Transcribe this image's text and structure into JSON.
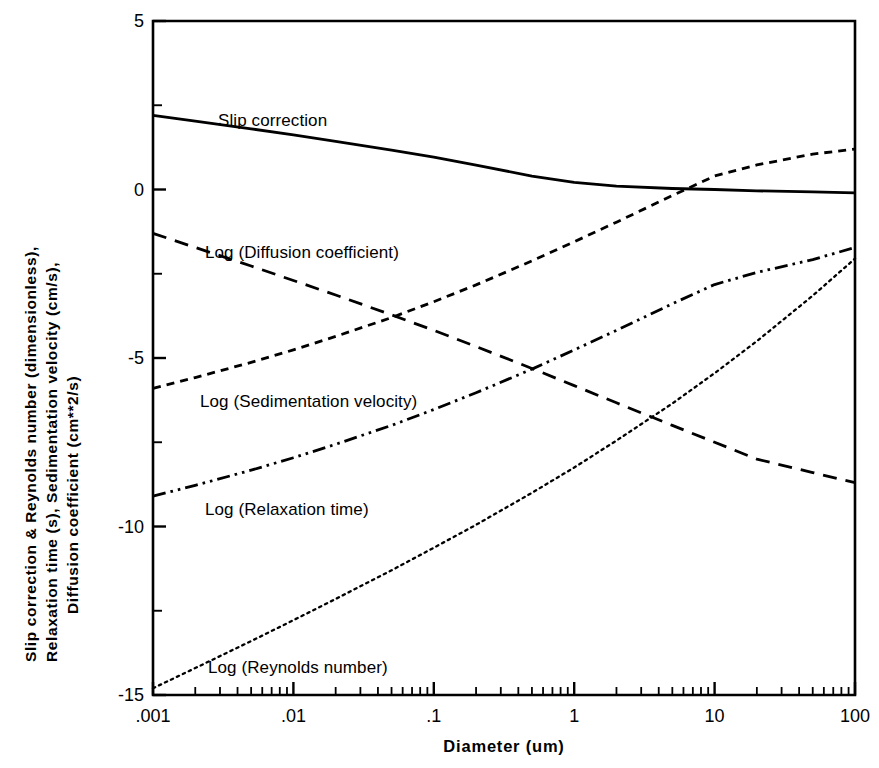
{
  "chart_data": {
    "type": "line",
    "title": "",
    "xlabel": "Diameter  (um)",
    "ylabel_lines": [
      "Slip correction & Reynolds number (dimensionless),",
      "Relaxation time (s), Sedimentation velocity (cm/s),",
      "Diffusion coefficient  (cm**2/s)"
    ],
    "xscale": "log",
    "xlim": [
      0.001,
      100
    ],
    "ylim": [
      -15,
      5
    ],
    "xticks": [
      0.001,
      0.01,
      0.1,
      1,
      10,
      100
    ],
    "xtick_labels": [
      ".001",
      ".01",
      ".1",
      "1",
      "10",
      "100"
    ],
    "yticks": [
      5,
      0,
      -5,
      -10,
      -15
    ],
    "ytick_labels": [
      "5",
      "0",
      "-5",
      "-10",
      "-15"
    ],
    "yminor_ticks": [
      2.5,
      -2.5,
      -7.5,
      -12.5
    ],
    "grid": false,
    "legend_position": "inline-annotations",
    "series": [
      {
        "name": "Slip correction",
        "label": "Slip correction",
        "style": "solid",
        "color": "#000000",
        "x": [
          0.001,
          0.002,
          0.005,
          0.01,
          0.02,
          0.05,
          0.1,
          0.2,
          0.5,
          1,
          2,
          5,
          10,
          20,
          50,
          100
        ],
        "y": [
          2.2,
          2.03,
          1.8,
          1.62,
          1.43,
          1.17,
          0.96,
          0.72,
          0.4,
          0.21,
          0.1,
          0.03,
          0.0,
          -0.04,
          -0.07,
          -0.1
        ]
      },
      {
        "name": "Log (Diffusion coefficient)",
        "label": "Log (Diffusion coefficient)",
        "style": "long-dash",
        "color": "#000000",
        "x": [
          0.001,
          0.002,
          0.005,
          0.01,
          0.02,
          0.05,
          0.1,
          0.2,
          0.5,
          1,
          2,
          5,
          10,
          20,
          50,
          100
        ],
        "y": [
          -1.3,
          -1.72,
          -2.27,
          -2.7,
          -3.13,
          -3.72,
          -4.18,
          -4.66,
          -5.31,
          -5.82,
          -6.33,
          -7.0,
          -7.5,
          -8.0,
          -8.4,
          -8.7
        ]
      },
      {
        "name": "Log (Sedimentation velocity)",
        "label": "Log (Sedimentation velocity)",
        "style": "short-dash",
        "color": "#000000",
        "x": [
          0.001,
          0.002,
          0.005,
          0.01,
          0.02,
          0.05,
          0.1,
          0.2,
          0.5,
          1,
          2,
          5,
          10,
          20,
          50,
          100
        ],
        "y": [
          -5.9,
          -5.58,
          -5.13,
          -4.76,
          -4.36,
          -3.8,
          -3.33,
          -2.83,
          -2.12,
          -1.55,
          -0.97,
          -0.18,
          0.4,
          0.73,
          1.05,
          1.2
        ]
      },
      {
        "name": "Log (Relaxation time)",
        "label": "Log (Relaxation time)",
        "style": "dash-dot-dot",
        "color": "#000000",
        "x": [
          0.001,
          0.002,
          0.005,
          0.01,
          0.02,
          0.05,
          0.1,
          0.2,
          0.5,
          1,
          2,
          5,
          10,
          20,
          50,
          100
        ],
        "y": [
          -9.1,
          -8.78,
          -8.33,
          -7.96,
          -7.56,
          -7.0,
          -6.53,
          -6.03,
          -5.33,
          -4.76,
          -4.18,
          -3.39,
          -2.82,
          -2.46,
          -2.08,
          -1.72
        ]
      },
      {
        "name": "Log (Reynolds number)",
        "label": "Log (Reynolds number)",
        "style": "dotted",
        "color": "#000000",
        "x": [
          0.001,
          0.002,
          0.005,
          0.01,
          0.02,
          0.05,
          0.1,
          0.2,
          0.5,
          1,
          2,
          5,
          10,
          20,
          50,
          100
        ],
        "y": [
          -14.8,
          -14.2,
          -13.4,
          -12.78,
          -12.15,
          -11.3,
          -10.63,
          -9.95,
          -9.0,
          -8.25,
          -7.45,
          -6.35,
          -5.45,
          -4.5,
          -3.15,
          -2.05
        ]
      }
    ],
    "annotations": [
      {
        "text": "Slip correction",
        "x_px": 218,
        "y_px": 111
      },
      {
        "text": "Log (Diffusion coefficient)",
        "x_px": 205,
        "y_px": 243
      },
      {
        "text": "Log (Sedimentation velocity)",
        "x_px": 200,
        "y_px": 392
      },
      {
        "text": "Log (Relaxation time)",
        "x_px": 205,
        "y_px": 500
      },
      {
        "text": "Log (Reynolds number)",
        "x_px": 208,
        "y_px": 658
      }
    ]
  }
}
